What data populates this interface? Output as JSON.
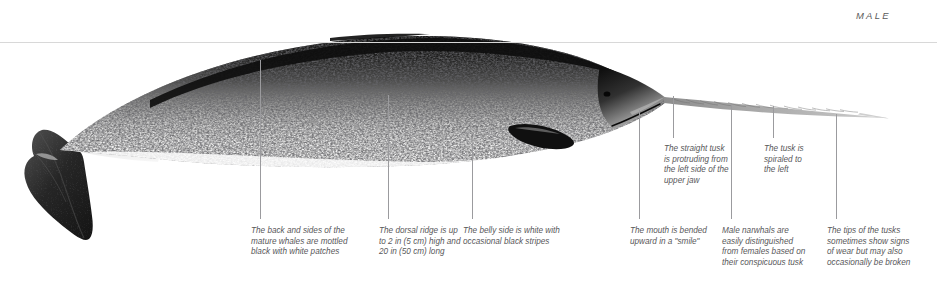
{
  "figure": {
    "subject": "narwhal",
    "sex_label": "MALE",
    "reference_rule": {
      "y": 42,
      "color": "#d8d8d8"
    },
    "palette": {
      "text": "#58585a",
      "label": "#5a5a5a",
      "leader_line": "#9b9b9e",
      "body_dark": "#1a1a1a",
      "body_light": "#f2f2f2",
      "background": "#ffffff"
    }
  },
  "male_label": {
    "text": "MALE",
    "x": 856,
    "y": 10
  },
  "annotations": [
    {
      "id": "back-and-sides",
      "text": "The back and sides of the\nmature whales are mottled\nblack with white patches",
      "x": 251,
      "y": 226,
      "width": 118,
      "leader": {
        "x": 260,
        "y_top": 60,
        "y_bottom": 219
      }
    },
    {
      "id": "dorsal-ridge",
      "text": "The dorsal ridge is up\nto 2 in (5 cm) high and\n20 in (50 cm) long",
      "x": 379,
      "y": 226,
      "width": 92,
      "leader": {
        "x": 388,
        "y_top": 95,
        "y_bottom": 219
      }
    },
    {
      "id": "belly-side",
      "text": "The belly side is white with\noccasional black stripes",
      "x": 463,
      "y": 226,
      "width": 122,
      "leader": {
        "x": 472,
        "y_top": 143,
        "y_bottom": 219
      }
    },
    {
      "id": "mouth-smile",
      "text": "The mouth is bended\nupward in a \"smile\"",
      "x": 630,
      "y": 226,
      "width": 92,
      "leader": {
        "x": 639,
        "y_top": 110,
        "y_bottom": 219
      }
    },
    {
      "id": "male-tusk-distinction",
      "text": "Male narwhals are\neasily distinguished\nfrom females based on\ntheir conspicuous tusk",
      "x": 722,
      "y": 226,
      "width": 102,
      "leader": {
        "x": 731,
        "y_top": 104,
        "y_bottom": 219
      }
    },
    {
      "id": "tusk-tips-wear",
      "text": "The tips of the tusks\nsometimes show signs\nof wear but may also\noccasionally be broken",
      "x": 827,
      "y": 226,
      "width": 104,
      "leader": {
        "x": 836,
        "y_top": 114,
        "y_bottom": 219
      }
    },
    {
      "id": "straight-tusk",
      "text": "The straight tusk\nis protruding from\nthe left side of the\nupper jaw",
      "x": 664,
      "y": 144,
      "width": 86,
      "leader": {
        "x": 673,
        "y_top": 96,
        "y_bottom": 138
      }
    },
    {
      "id": "tusk-spiral",
      "text": "The tusk is\nspiraled to\nthe left",
      "x": 764,
      "y": 144,
      "width": 66,
      "leader": {
        "x": 773,
        "y_top": 106,
        "y_bottom": 138
      }
    }
  ]
}
